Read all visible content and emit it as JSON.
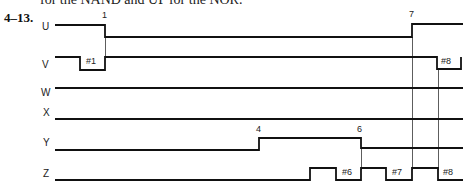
{
  "header": {
    "cut_text": "for the NAND and UP for the NOR."
  },
  "problem": {
    "number": "4–13."
  },
  "signals": [
    {
      "name": "U"
    },
    {
      "name": "V"
    },
    {
      "name": "W"
    },
    {
      "name": "X"
    },
    {
      "name": "Y"
    },
    {
      "name": "Z"
    }
  ],
  "events": {
    "e1": "1",
    "e7": "7",
    "e4": "4",
    "e6": "6",
    "h1": "#1",
    "h8v": "#8",
    "h6": "#6",
    "h7": "#7",
    "h8z": "#8"
  },
  "colors": {
    "trace": "#111111",
    "marker": "#333333",
    "background": "#ffffff"
  }
}
